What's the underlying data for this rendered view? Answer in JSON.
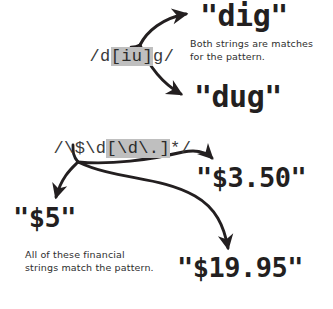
{
  "diagram": {
    "ink_color": "#231f20",
    "highlight_color": "#bfbfbf",
    "pattern_color": "#3a3a3a",
    "background_color": "#ffffff"
  },
  "groups": [
    {
      "id": "dig-dug",
      "pattern": {
        "prefix": "/d",
        "highlight": "[iu]",
        "suffix": "g/",
        "full": "/d[iu]g/"
      },
      "matches": [
        {
          "id": "match-dig",
          "text": "\"dig\""
        },
        {
          "id": "match-dug",
          "text": "\"dug\""
        }
      ],
      "note": "Both strings are matches\nfor the pattern."
    },
    {
      "id": "money",
      "pattern": {
        "prefix": "/\\$\\d",
        "highlight": "[\\d\\.]",
        "suffix": "*/",
        "full": "/\\$\\d[\\d\\.]*/"
      },
      "matches": [
        {
          "id": "match-350",
          "text": "\"$3.50\""
        },
        {
          "id": "match-5",
          "text": "\"$5\""
        },
        {
          "id": "match-1995",
          "text": "\"$19.95\""
        }
      ],
      "note": "All of these financial\nstrings match the pattern."
    }
  ]
}
